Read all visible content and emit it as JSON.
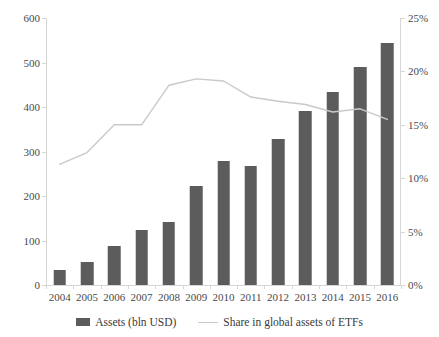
{
  "chart_data": {
    "type": "bar",
    "title": "",
    "subtitle": "",
    "xlabel": "",
    "ylabel": "",
    "grid": false,
    "legend_position": "bottom",
    "categories": [
      "2004",
      "2005",
      "2006",
      "2007",
      "2008",
      "2009",
      "2010",
      "2011",
      "2012",
      "2013",
      "2014",
      "2015",
      "2016"
    ],
    "series": [
      {
        "name": "Assets (bln USD)",
        "type": "bar",
        "axis": "left",
        "color": "#5c5c5c",
        "values": [
          34,
          51,
          88,
          123,
          141,
          223,
          278,
          267,
          329,
          392,
          434,
          490,
          544
        ]
      },
      {
        "name": "Share in global assets of ETFs",
        "type": "line",
        "axis": "right",
        "color": "#c9c9c9",
        "values": [
          11.3,
          12.4,
          15.0,
          15.0,
          18.7,
          19.3,
          19.1,
          17.6,
          17.2,
          16.9,
          16.2,
          16.5,
          15.5
        ]
      }
    ],
    "y_left": {
      "min": 0,
      "max": 600,
      "step": 100,
      "ticks": [
        0,
        100,
        200,
        300,
        400,
        500,
        600
      ],
      "tick_labels": [
        "0",
        "100",
        "200",
        "300",
        "400",
        "500",
        "600"
      ]
    },
    "y_right": {
      "min": 0,
      "max": 25,
      "step": 5,
      "ticks": [
        0,
        5,
        10,
        15,
        20,
        25
      ],
      "tick_labels": [
        "0%",
        "5%",
        "10%",
        "15%",
        "20%",
        "25%"
      ]
    },
    "legend": [
      {
        "label": "Assets (bln USD)",
        "marker": "bar-swatch",
        "color": "#5c5c5c"
      },
      {
        "label": "Share in global assets of ETFs",
        "marker": "line-swatch",
        "color": "#c9c9c9"
      }
    ]
  }
}
